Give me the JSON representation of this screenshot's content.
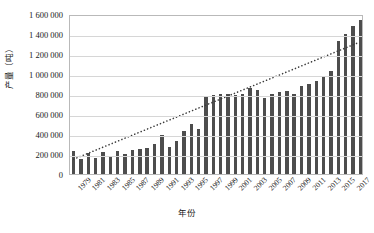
{
  "chart_data": {
    "type": "bar",
    "title": "",
    "xlabel": "年份",
    "ylabel": "产量（吨）",
    "ylim": [
      0,
      1600000
    ],
    "ytick_labels": [
      "0",
      "200 000",
      "400 000",
      "600 000",
      "800 000",
      "1 000 000",
      "1 200 000",
      "1 400 000",
      "1 600 000"
    ],
    "ytick_values": [
      0,
      200000,
      400000,
      600000,
      800000,
      1000000,
      1200000,
      1400000,
      1600000
    ],
    "grid": true,
    "legend": "none",
    "bar_color": "#4d4d4d",
    "trendline": {
      "type": "linear",
      "style": "dotted",
      "color": "#3a3a3a",
      "start_value": 150000,
      "end_value": 1330000
    },
    "categories": [
      "1979",
      "1980",
      "1981",
      "1982",
      "1983",
      "1984",
      "1985",
      "1986",
      "1987",
      "1988",
      "1989",
      "1990",
      "1991",
      "1992",
      "1993",
      "1994",
      "1995",
      "1996",
      "1997",
      "1998",
      "1999",
      "2000",
      "2001",
      "2002",
      "2003",
      "2004",
      "2005",
      "2006",
      "2007",
      "2008",
      "2009",
      "2010",
      "2011",
      "2012",
      "2013",
      "2014",
      "2015",
      "2016",
      "2017",
      "2018"
    ],
    "x_tick_labels": [
      "1979",
      "1981",
      "1983",
      "1985",
      "1987",
      "1989",
      "1991",
      "1993",
      "1995",
      "1997",
      "1999",
      "2001",
      "2003",
      "2005",
      "2007",
      "2009",
      "2011",
      "2013",
      "2015",
      "2017"
    ],
    "values": [
      230000,
      150000,
      215000,
      160000,
      225000,
      180000,
      230000,
      200000,
      240000,
      250000,
      265000,
      300000,
      390000,
      270000,
      330000,
      430000,
      500000,
      450000,
      770000,
      790000,
      800000,
      800000,
      790000,
      800000,
      860000,
      840000,
      760000,
      800000,
      820000,
      830000,
      800000,
      880000,
      900000,
      930000,
      970000,
      1030000,
      1330000,
      1400000,
      1480000,
      1540000
    ]
  }
}
